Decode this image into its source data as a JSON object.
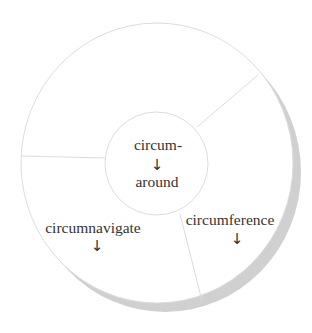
{
  "diagram": {
    "center": {
      "prefix": "circum-",
      "arrow": "↓",
      "meaning": "around"
    },
    "segments": [
      {
        "word": "circumnavigate",
        "arrow": "↓"
      },
      {
        "word": "circumference",
        "arrow": "↓"
      },
      {
        "word": "",
        "arrow": ""
      }
    ]
  },
  "colors": {
    "outline": "#dddddd",
    "shadow": "#d0d0d0",
    "text": "#333333",
    "fill": "#ffffff"
  }
}
